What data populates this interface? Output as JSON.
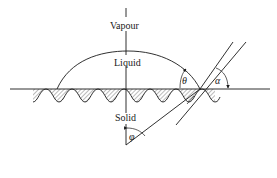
{
  "figure": {
    "labels": {
      "vapour": "Vapour",
      "liquid": "Liquid",
      "solid": "Solid"
    },
    "angles": {
      "theta": "θ",
      "alpha": "α",
      "phi": "φ"
    },
    "colors": {
      "ink": "#1a1a1a",
      "background": "#ffffff"
    }
  }
}
